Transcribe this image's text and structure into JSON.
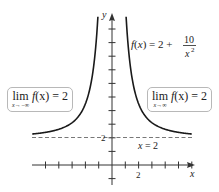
{
  "chart_data": {
    "type": "line",
    "title": "",
    "function_label": {
      "lhs": "f(x) = 2 + ",
      "numerator": "10",
      "denominator": "x",
      "denominator_exponent": "2"
    },
    "xlabel": "x",
    "ylabel": "y",
    "x_tick_labels": [
      {
        "value": 2,
        "label": "2"
      }
    ],
    "y_tick_labels": [
      {
        "value": 2,
        "label": "2"
      }
    ],
    "x_ticks": [
      -5,
      -4,
      -3,
      -2,
      -1,
      1,
      2,
      3,
      4,
      5,
      6
    ],
    "y_ticks": [
      -1,
      1,
      2,
      3,
      4,
      5,
      6,
      7,
      8,
      9,
      10
    ],
    "xlim": [
      -6.5,
      6.3
    ],
    "ylim": [
      -2,
      11
    ],
    "grid": false,
    "series": [
      {
        "name": "f(x) = 2 + 10/x^2",
        "x": [
          -6,
          -5,
          -4,
          -3,
          -2.5,
          -2,
          -1.6,
          -1.4,
          -1.2,
          -1.1,
          1.1,
          1.2,
          1.4,
          1.6,
          2,
          2.5,
          3,
          4,
          5,
          6
        ],
        "values": [
          2.28,
          2.4,
          2.63,
          3.11,
          3.6,
          4.5,
          5.91,
          7.1,
          8.94,
          10.26,
          10.26,
          8.94,
          7.1,
          5.91,
          4.5,
          3.6,
          3.11,
          2.63,
          2.4,
          2.28
        ]
      }
    ],
    "asymptotes": [
      {
        "type": "horizontal",
        "y": 2,
        "style": "dashed",
        "label": "y = 2"
      }
    ],
    "annotations": [
      {
        "text": "lim f(x) = 2",
        "subscript": "x→−∞",
        "position": "left"
      },
      {
        "text": "lim f(x) = 2",
        "subscript": "x→∞",
        "position": "right"
      }
    ]
  },
  "labels": {
    "x_axis": "x",
    "y_axis": "y",
    "x_tick_2": "2",
    "y_tick_2": "2",
    "asymptote": "y = 2",
    "func_lhs": "f(x) = 2 +",
    "func_num": "10",
    "func_den": "x",
    "func_exp": "2"
  },
  "callouts": {
    "left": {
      "lim": "lim",
      "sub": "x→−∞",
      "expr_f": "f",
      "expr_rest": "(x) = 2"
    },
    "right": {
      "lim": "lim",
      "sub": "x→∞",
      "expr_f": "f",
      "expr_rest": "(x) = 2"
    }
  }
}
